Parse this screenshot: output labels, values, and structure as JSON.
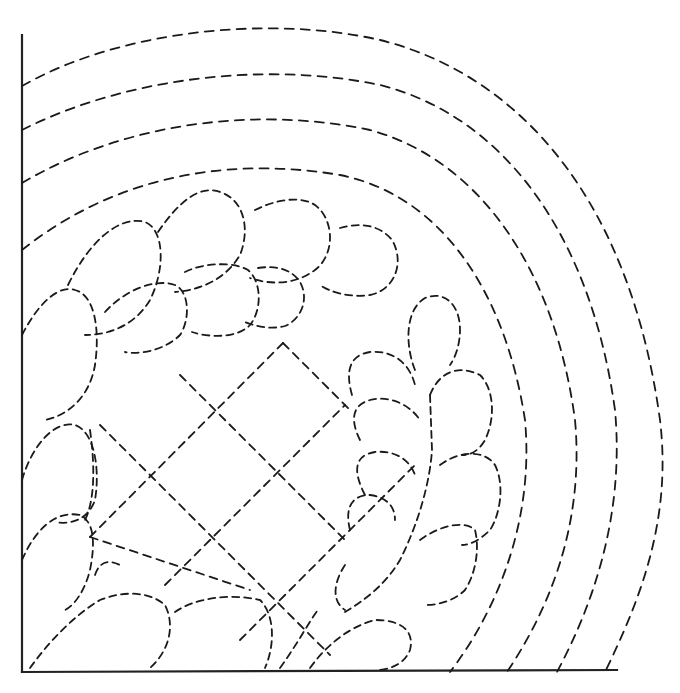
{
  "diagram": {
    "type": "quilting-pattern",
    "colors": {
      "background": "#ffffff",
      "line": "#1a1a1a",
      "axis": "#222222"
    },
    "axes": {
      "left": {
        "x1": 22,
        "y1": 35,
        "x2": 22,
        "y2": 672
      },
      "bottom": {
        "x1": 22,
        "y1": 672,
        "x2": 617,
        "y2": 670
      }
    },
    "echo_arcs": [
      "M22,86 C120,30 270,15 380,40 C520,75 630,200 660,420 C672,520 640,600 605,672",
      "M22,130 C120,80 260,60 380,85 C500,115 590,230 615,410 C625,520 590,610 557,672",
      "M22,183 C120,125 250,105 370,130 C480,160 555,270 575,420 C585,530 545,615 507,672",
      "M22,250 C110,180 220,155 340,175 C440,195 505,290 525,420 C535,530 490,620 450,672"
    ],
    "feathers_upper": [
      "M22,335 C40,300 60,285 75,290 C95,295 100,330 95,365 C90,395 70,415 45,420",
      "M68,285 C90,240 120,215 145,222 C165,230 165,270 150,300 C135,325 110,335 85,335",
      "M158,232 C180,200 200,185 220,192 C245,200 250,230 240,255 C225,280 200,290 175,292",
      "M255,210 C275,200 300,195 315,205 C335,220 335,255 315,270 C295,285 270,285 250,278",
      "M340,228 C360,222 380,225 392,240 C405,262 395,290 370,295 C350,298 330,292 320,285",
      "M105,312 C125,290 155,278 175,285 C190,292 190,320 180,335 C165,350 140,355 125,352",
      "M185,272 C205,262 235,262 248,270 C262,282 262,310 250,325 C238,338 210,338 192,332",
      "M258,268 C278,265 292,270 300,282 C310,300 300,320 285,326 C270,330 255,326 245,322"
    ],
    "feathers_left": [
      "M22,480 C32,445 55,420 75,425 C95,432 100,470 95,500 C88,520 70,525 55,522",
      "M22,560 C35,530 55,510 80,515 C95,522 95,545 90,570 C85,590 75,605 65,610",
      "M90,430 C95,465 95,500 85,520",
      "M95,575 C100,560 110,560 120,565"
    ],
    "feathers_bottom": [
      "M30,668 C50,640 75,615 100,600 C125,590 150,592 165,605 C175,625 170,650 150,668",
      "M175,612 C195,598 230,593 260,600 C275,615 275,645 265,668",
      "M280,668 C300,640 310,620 318,610",
      "M310,668 C330,640 355,625 375,620 C400,620 415,630 410,650 C405,662 395,668 380,670"
    ],
    "feathers_right": [
      "M415,370 C405,345 405,310 425,298 C445,290 460,305 460,330 C460,345 455,358 450,365",
      "M352,395 C345,370 350,355 370,352 C395,350 410,365 415,385",
      "M360,440 C350,420 352,405 370,400 C390,395 410,405 420,420",
      "M365,495 C352,470 355,455 375,452 C395,450 410,460 415,475",
      "M350,530 C345,510 350,495 370,495 C385,497 395,505 395,520",
      "M430,395 C440,370 460,365 480,375 C495,390 495,420 485,440 C478,452 470,455 462,455",
      "M440,465 C460,450 485,450 495,465 C505,485 500,515 490,530 C480,540 470,545 462,545",
      "M420,540 C440,525 465,520 475,530 C480,550 475,575 465,590 C455,600 440,605 425,605",
      "M345,565 C335,580 330,600 345,610",
      "M430,395 L432,450 C430,480 420,520 400,560 C385,585 365,600 345,612"
    ],
    "lattice": [
      "M90,537 L283,343",
      "M283,343 L352,412",
      "M165,585 L345,405",
      "M240,640 L415,465",
      "M100,425 L330,655",
      "M180,375 L345,540",
      "M90,537 L250,590"
    ]
  }
}
